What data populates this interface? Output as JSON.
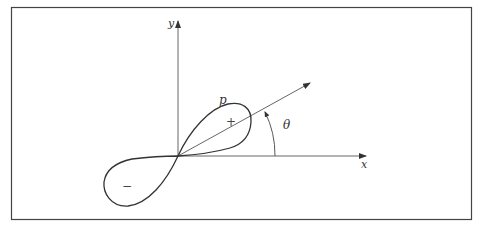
{
  "diagram": {
    "type": "p-orbital polar plot",
    "axes": {
      "x_label": "x",
      "y_label": "y"
    },
    "curve_label": "p",
    "angle_label": "θ",
    "lobes": [
      {
        "name": "positive-lobe",
        "sign": "+"
      },
      {
        "name": "negative-lobe",
        "sign": "−"
      }
    ]
  },
  "colors": {
    "line": "#333333",
    "frame": "#444444",
    "background": "#ffffff"
  }
}
